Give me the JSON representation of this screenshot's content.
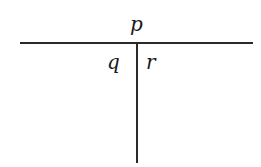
{
  "diagram": {
    "type": "t-chart",
    "top_label": "p",
    "left_label": "q",
    "right_label": "r"
  }
}
